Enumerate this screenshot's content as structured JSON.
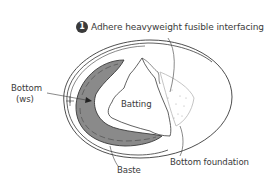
{
  "diagram": {
    "callout": {
      "step_number": "1",
      "text": "Adhere heavyweight fusible interfacing"
    },
    "labels": {
      "bottom_ws_line1": "Bottom",
      "bottom_ws_line2": "(ws)",
      "batting": "Batting",
      "baste": "Baste",
      "bottom_foundation": "Bottom foundation"
    },
    "colors": {
      "outline": "#3a3a3a",
      "fabric_fill": "#8a8a8a",
      "interfacing_outline": "#bdbdbd",
      "background": "#ffffff"
    }
  }
}
